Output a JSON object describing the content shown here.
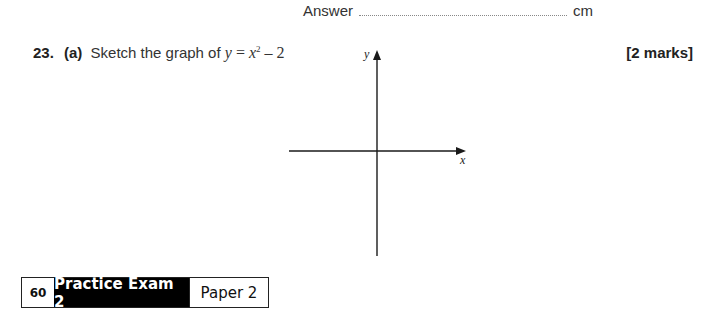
{
  "answer": {
    "label": "Answer",
    "unit": "cm"
  },
  "question": {
    "number": "23.",
    "part": "(a)",
    "instruction": "Sketch the graph of",
    "equation": {
      "lhs": "y",
      "equals": "=",
      "variable": "x",
      "exponent": "2",
      "minus": "–",
      "constant": "2"
    },
    "marks": "[2 marks]"
  },
  "axes": {
    "x_label": "x",
    "y_label": "y"
  },
  "footer": {
    "page_number": "60",
    "title": "Practice Exam 2",
    "paper": "Paper 2"
  }
}
